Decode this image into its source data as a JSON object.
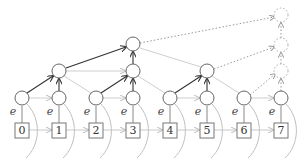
{
  "diagram": {
    "type": "tree-over-array",
    "colors": {
      "dark_edge": "#333333",
      "light_edge": "#c8c8c8",
      "dotted_edge": "#aaaaaa",
      "node_stroke": "#666666"
    },
    "leaves": [
      {
        "label": "0",
        "eps": "e"
      },
      {
        "label": "1",
        "eps": "e"
      },
      {
        "label": "2",
        "eps": "e"
      },
      {
        "label": "3",
        "eps": "e"
      },
      {
        "label": "4",
        "eps": "e"
      },
      {
        "label": "5",
        "eps": "e"
      },
      {
        "label": "6",
        "eps": "e"
      },
      {
        "label": "7",
        "eps": "e"
      }
    ]
  }
}
